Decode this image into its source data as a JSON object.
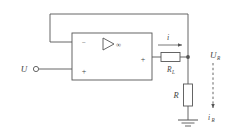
{
  "figure": {
    "type": "circuit-schematic",
    "background_color": "#ffffff",
    "line_color": "#555555",
    "text_color": "#444444"
  },
  "opamp": {
    "name": "operational-amplifier",
    "gain_symbol": "∞",
    "triangle_symbol": "▷",
    "inverting_input_label": "−",
    "noninverting_input_label": "+",
    "output_label": "+"
  },
  "source": {
    "label": "U",
    "terminal_symbol": "○"
  },
  "components": [
    {
      "name": "load-resistor",
      "label": "R",
      "subscript": "L",
      "orientation": "horizontal"
    },
    {
      "name": "sense-resistor",
      "label": "R",
      "subscript": "",
      "orientation": "vertical"
    }
  ],
  "currents": [
    {
      "name": "output-current",
      "label": "i",
      "subscript": "",
      "direction": "right"
    },
    {
      "name": "sense-current",
      "label": "i",
      "subscript": "R",
      "direction": "down"
    }
  ],
  "voltages": [
    {
      "name": "output-voltage",
      "label": "U",
      "subscript": "R",
      "style": "dashed-arrow-down"
    }
  ],
  "nodes": [
    {
      "name": "output-node",
      "type": "junction-dot"
    }
  ],
  "ground": {
    "name": "ground-symbol",
    "type": "earth"
  },
  "wires": [
    {
      "name": "feedback-wire",
      "path": "output-node to inverting-input (top loop)"
    },
    {
      "name": "input-wire",
      "path": "source U to non-inverting input"
    },
    {
      "name": "output-wire",
      "path": "opamp output through load resistor to node"
    },
    {
      "name": "sense-wire",
      "path": "node through sense resistor to ground"
    }
  ]
}
